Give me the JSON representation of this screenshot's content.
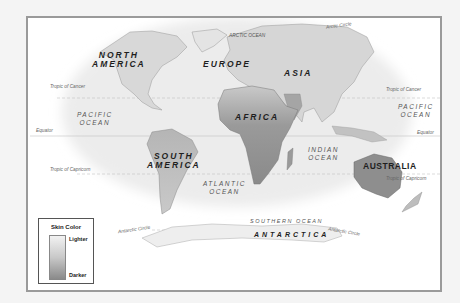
{
  "map": {
    "title": "World skin color distribution map",
    "continents": [
      {
        "id": "north-america",
        "label": "NORTH\nAMERICA",
        "x": 92,
        "y": 31
      },
      {
        "id": "south-america",
        "label": "SOUTH\nAMERICA",
        "x": 118,
        "y": 132
      },
      {
        "id": "europe",
        "label": "EUROPE",
        "x": 207,
        "y": 44
      },
      {
        "id": "asia",
        "label": "ASIA",
        "x": 278,
        "y": 53
      },
      {
        "id": "africa",
        "label": "AFRICA",
        "x": 232,
        "y": 97
      },
      {
        "id": "australia",
        "label": "AUSTRALIA",
        "x": 360,
        "y": 146
      },
      {
        "id": "antarctica",
        "label": "ANTARCTICA",
        "x": 257,
        "y": 212
      }
    ],
    "oceans": [
      {
        "id": "arctic-ocean",
        "label": "ARCTIC OCEAN",
        "x": 228,
        "y": 15
      },
      {
        "id": "pacific-ocean-west",
        "label": "PACIFIC\nOCEAN",
        "x": 78,
        "y": 95
      },
      {
        "id": "pacific-ocean-east",
        "label": "PACIFIC\nOCEAN",
        "x": 400,
        "y": 85
      },
      {
        "id": "atlantic-ocean",
        "label": "ATLANTIC\nOCEAN",
        "x": 205,
        "y": 165
      },
      {
        "id": "indian-ocean",
        "label": "INDIAN\nOCEAN",
        "x": 310,
        "y": 136
      },
      {
        "id": "southern-ocean",
        "label": "SOUTHERN OCEAN",
        "x": 255,
        "y": 200
      }
    ],
    "lines": [
      {
        "id": "arctic-circle",
        "label": "Arctic Circle",
        "x": 326,
        "y": 22
      },
      {
        "id": "tropic-of-cancer-west",
        "label": "Tropic of Cancer",
        "x": 48,
        "y": 71
      },
      {
        "id": "tropic-of-cancer-east",
        "label": "Tropic of Cancer",
        "x": 386,
        "y": 74
      },
      {
        "id": "equator-west",
        "label": "Equator",
        "x": 36,
        "y": 111
      },
      {
        "id": "equator-east",
        "label": "Equator",
        "x": 417,
        "y": 114
      },
      {
        "id": "tropic-of-capricorn-west",
        "label": "Tropic of Capricorn",
        "x": 48,
        "y": 167
      },
      {
        "id": "tropic-of-capricorn-east",
        "label": "Tropic of Capricorn",
        "x": 385,
        "y": 160
      },
      {
        "id": "antarctic-circle-west",
        "label": "Antarctic Circle",
        "x": 117,
        "y": 228
      },
      {
        "id": "antarctic-circle-east",
        "label": "Antarctic Circle",
        "x": 328,
        "y": 229
      }
    ]
  },
  "legend": {
    "title": "Skin Color",
    "high_label": "Lighter",
    "low_label": "Darker",
    "gradient": [
      "#f2f2f2",
      "#c8c8c8",
      "#8a8a8a"
    ]
  },
  "colors": {
    "frame_border": "#9a9a9a",
    "land_light": "#dcdcdc",
    "land_mid": "#bdbdbd",
    "land_dark": "#8e8e8e",
    "background": "#ffffff"
  }
}
